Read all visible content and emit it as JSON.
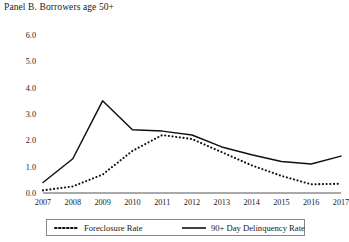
{
  "panel": {
    "title": "Panel B. Borrowers age 50+"
  },
  "legend": {
    "items": [
      {
        "label": "Foreclosure Rate",
        "style": "dotted",
        "color": "#111111",
        "icon": "dotted-line-swatch-icon"
      },
      {
        "label": "90+ Day Delinquency Rate",
        "style": "solid",
        "color": "#111111",
        "icon": "solid-line-swatch-icon"
      }
    ]
  },
  "chart_data": {
    "type": "line",
    "title": "Panel B. Borrowers age 50+",
    "xlabel": "",
    "ylabel": "",
    "categories": [
      "2007",
      "2008",
      "2009",
      "2010",
      "2011",
      "2012",
      "2013",
      "2014",
      "2015",
      "2016",
      "2017"
    ],
    "x_tick_labels": [
      "2007",
      "2008",
      "2009",
      "2010",
      "2011",
      "2012",
      "2013",
      "2014",
      "2015",
      "2016",
      "2017"
    ],
    "y_tick_labels": [
      "0.0",
      "1.0",
      "2.0",
      "3.0",
      "4.0",
      "5.0",
      "6.0"
    ],
    "y_ticks": [
      0.0,
      1.0,
      2.0,
      3.0,
      4.0,
      5.0,
      6.0
    ],
    "ylim": [
      0.0,
      6.0
    ],
    "grid": false,
    "legend_position": "bottom",
    "series": [
      {
        "name": "Foreclosure Rate",
        "style": "dotted",
        "color": "#111111",
        "values": [
          0.1,
          0.25,
          0.7,
          1.6,
          2.2,
          2.05,
          1.55,
          1.05,
          0.65,
          0.33,
          0.35
        ]
      },
      {
        "name": "90+ Day Delinquency Rate",
        "style": "solid",
        "color": "#111111",
        "values": [
          0.4,
          1.3,
          3.5,
          2.4,
          2.35,
          2.2,
          1.75,
          1.45,
          1.2,
          1.1,
          1.4
        ]
      }
    ]
  }
}
